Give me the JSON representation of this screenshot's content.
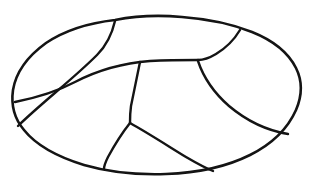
{
  "figure": {
    "background_color": "#ffffff",
    "stroke_color": "#141414",
    "canvas": {
      "width": 312,
      "height": 187
    },
    "outline": {
      "name": "oval-outline",
      "stroke_width": 2.6,
      "path": "M 115 20 C 135 16 160 15 182 17 C 208 19 232 24 252 32 C 272 40 288 52 296 68 C 303 82 302 96 296 110 C 288 128 272 144 250 155 C 226 167 196 173 166 174 C 136 175 108 172 84 165 C 58 157 36 145 24 130 C 13 117 11 104 13 90 C 16 72 28 56 46 43 C 64 31 88 23 115 20 Z"
    },
    "interior_lines": [
      {
        "name": "upper-left-seam",
        "stroke_width": 2.4,
        "path": "M 115 21 C 112 34 106 46 97 55 C 86 66 70 80 56 92 C 42 104 28 116 18 126"
      },
      {
        "name": "horizontal-seam",
        "stroke_width": 2.4,
        "path": "M 15 102 C 35 98 56 92 75 82 C 98 70 124 63 150 61 C 170 60 186 60 198 60"
      },
      {
        "name": "upper-right-seam",
        "stroke_width": 2.4,
        "path": "M 240 30 C 234 40 226 48 216 54 C 206 60 200 60 198 60"
      },
      {
        "name": "right-panel-seam",
        "stroke_width": 2.4,
        "path": "M 198 61 C 203 76 213 92 229 106 C 248 122 270 131 288 134"
      },
      {
        "name": "center-vertical-seam",
        "stroke_width": 2.4,
        "path": "M 140 62 C 137 76 134 92 131 106 C 130 113 130 119 130 123"
      },
      {
        "name": "lower-left-seam",
        "stroke_width": 2.4,
        "path": "M 130 123 C 122 133 114 146 108 157 C 105 163 104 167 104 169"
      },
      {
        "name": "lower-right-seam",
        "stroke_width": 2.4,
        "path": "M 130 123 C 148 133 168 146 186 157 C 198 164 208 169 213 171"
      }
    ],
    "vertices": [
      {
        "name": "top-junction",
        "x": 115,
        "y": 20
      },
      {
        "name": "left-edge-junction",
        "x": 15,
        "y": 102
      },
      {
        "name": "horizontal-right-end",
        "x": 198,
        "y": 60
      },
      {
        "name": "top-right-junction",
        "x": 240,
        "y": 30
      },
      {
        "name": "right-edge-junction",
        "x": 288,
        "y": 134
      },
      {
        "name": "center-y-junction",
        "x": 130,
        "y": 123
      },
      {
        "name": "bottom-left-junction",
        "x": 104,
        "y": 169
      },
      {
        "name": "bottom-right-junction",
        "x": 213,
        "y": 171
      }
    ],
    "panels": [
      {
        "name": "panel-top-left"
      },
      {
        "name": "panel-top-center"
      },
      {
        "name": "panel-top-right"
      },
      {
        "name": "panel-left"
      },
      {
        "name": "panel-center-bottom"
      },
      {
        "name": "panel-right-bottom"
      }
    ]
  }
}
